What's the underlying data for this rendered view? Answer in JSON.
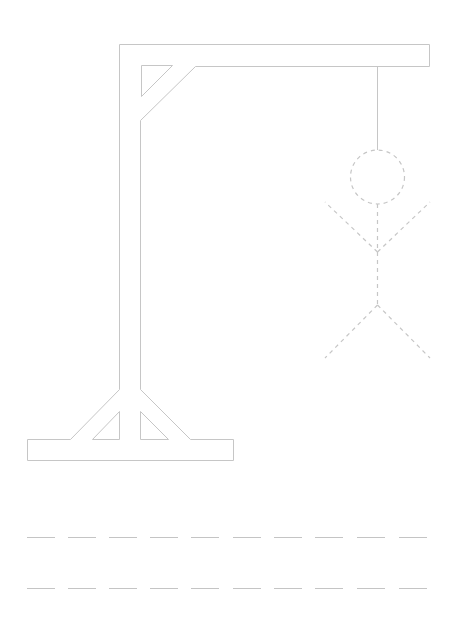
{
  "game": {
    "title": "Hangman",
    "stroke_color": "#c6c6c6",
    "figure_stroke_color": "#c6c6c6",
    "figure_parts": [
      "head",
      "body",
      "left-arm",
      "right-arm",
      "left-leg",
      "right-leg"
    ],
    "figure_style": "dashed"
  },
  "word_rows": [
    {
      "row": 1,
      "letters": [
        "",
        "",
        "",
        "",
        "",
        "",
        "",
        "",
        "",
        ""
      ]
    },
    {
      "row": 2,
      "letters": [
        "",
        "",
        "",
        "",
        "",
        "",
        "",
        "",
        "",
        ""
      ]
    }
  ]
}
